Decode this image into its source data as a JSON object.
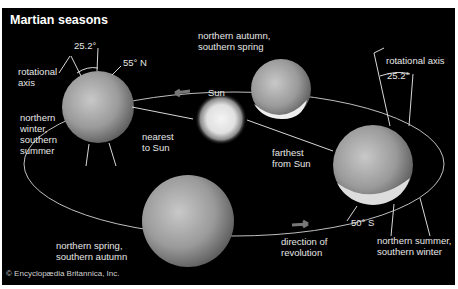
{
  "title": "Martian seasons",
  "copyright": "© Encyclopædia Britannica, Inc.",
  "labels": {
    "rot_axis_left": "rotational\naxis",
    "tilt_left": "25.2°",
    "lat_north": "55° N",
    "autumn": "northern autumn,\nsouthern spring",
    "rot_axis_right": "rotational axis",
    "tilt_right": "25.2°",
    "winter": "northern\nwinter,\nsouthern\nsummer",
    "sun": "Sun",
    "nearest": "nearest\nto Sun",
    "farthest": "farthest\nfrom Sun",
    "spring": "northern spring,\nsouthern autumn",
    "direction": "direction of\nrevolution",
    "lat_south": "50° S",
    "summer": "northern summer,\nsouthern winter"
  },
  "colors": {
    "background": "#000000",
    "frame": "#ffffff",
    "text": "#e6e6e6",
    "orbit": "#bfbfbf",
    "arrow": "#6e6e6e"
  }
}
